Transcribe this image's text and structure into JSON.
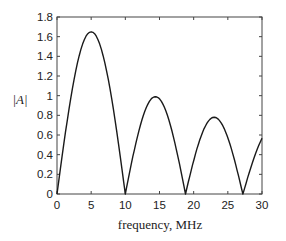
{
  "chart_data": {
    "type": "line",
    "title": "",
    "xlabel": "frequency, MHz",
    "ylabel": "|A|",
    "xlim": [
      0,
      30
    ],
    "ylim": [
      0,
      1.8
    ],
    "xticks": [
      0,
      5,
      10,
      15,
      20,
      25,
      30
    ],
    "yticks": [
      0,
      0.2,
      0.4,
      0.6,
      0.8,
      1,
      1.2,
      1.4,
      1.6,
      1.8
    ],
    "xtick_labels": [
      "0",
      "5",
      "10",
      "15",
      "20",
      "25",
      "30"
    ],
    "ytick_labels": [
      "0",
      "0.2",
      "0.4",
      "0.6",
      "0.8",
      "1",
      "1.2",
      "1.4",
      "1.6",
      "1.8"
    ],
    "grid": false,
    "legend": null,
    "series": [
      {
        "name": "|A|",
        "color": "#1a1a1a",
        "x": [
          0,
          1,
          2,
          3,
          4,
          5,
          6,
          7,
          8,
          9,
          10,
          11,
          12,
          13,
          14.3,
          15.5,
          16.5,
          17.5,
          18.8,
          19.8,
          21,
          22,
          23,
          24,
          25,
          26,
          27.2,
          28,
          29,
          30
        ],
        "y": [
          0,
          0.5,
          0.95,
          1.33,
          1.57,
          1.65,
          1.57,
          1.33,
          0.95,
          0.5,
          0,
          0.35,
          0.68,
          0.9,
          0.99,
          0.9,
          0.68,
          0.4,
          0,
          0.3,
          0.6,
          0.74,
          0.78,
          0.72,
          0.55,
          0.3,
          0,
          0.2,
          0.38,
          0.54
        ]
      }
    ]
  }
}
